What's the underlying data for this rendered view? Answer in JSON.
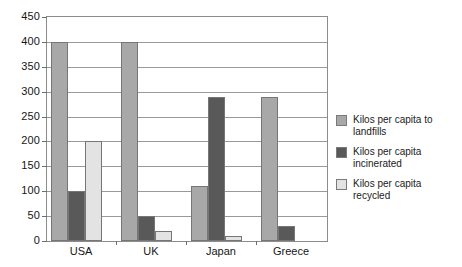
{
  "chart_data": {
    "type": "bar",
    "title": "",
    "subtitle": "",
    "xlabel": "",
    "ylabel": "",
    "ylim": [
      0,
      450
    ],
    "ytick_step": 50,
    "yticks": [
      "450",
      "400",
      "350",
      "300",
      "250",
      "200",
      "150",
      "100",
      "50",
      "0"
    ],
    "grid": true,
    "legend_position": "right",
    "categories": [
      "USA",
      "UK",
      "Japan",
      "Greece"
    ],
    "series": [
      {
        "name": "Kilos per capita to landfills",
        "color": "#a8a8a8",
        "values": [
          400,
          400,
          110,
          290
        ]
      },
      {
        "name": "Kilos per capita incinerated",
        "color": "#595959",
        "values": [
          100,
          50,
          290,
          30
        ]
      },
      {
        "name": "Kilos per capita recycled",
        "color": "#e3e3e3",
        "values": [
          200,
          20,
          10,
          0
        ]
      }
    ]
  },
  "legend": {
    "items": [
      {
        "label": "Kilos per capita to landfills"
      },
      {
        "label": "Kilos per capita incinerated"
      },
      {
        "label": "Kilos per capita recycled"
      }
    ]
  },
  "axes": {
    "y_labels": [
      "450",
      "400",
      "350",
      "300",
      "250",
      "200",
      "150",
      "100",
      "50",
      "0"
    ],
    "x_labels": [
      "USA",
      "UK",
      "Japan",
      "Greece"
    ]
  },
  "colors": {
    "series_landfill": "#a8a8a8",
    "series_incinerated": "#595959",
    "series_recycled": "#e3e3e3",
    "frame": "#8c8c8c",
    "gridline": "#9a9a9a",
    "text": "#161616"
  }
}
